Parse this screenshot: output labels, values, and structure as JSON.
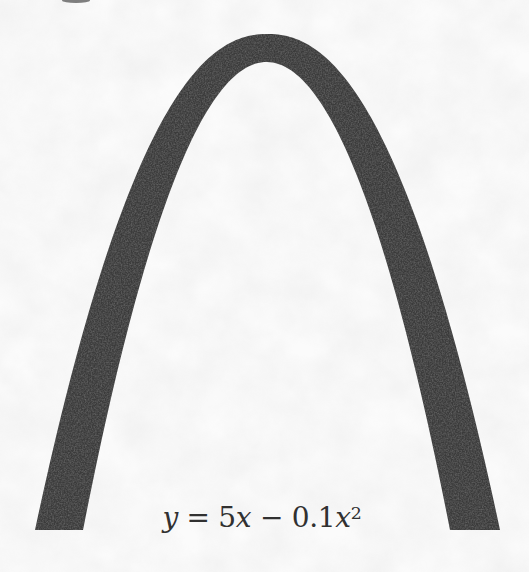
{
  "figure": {
    "equation": {
      "full": "y = 5x − 0.1x²",
      "lhs_var": "y",
      "equals_and_coeff": " = 5",
      "var_x1": "x",
      "minus_and_coeff": " − 0.1",
      "var_x2": "x",
      "exponent": "2"
    },
    "arch_color": "#3b3b3b",
    "paper_color": "#fbfbfb"
  }
}
